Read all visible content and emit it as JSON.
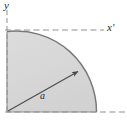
{
  "figure": {
    "name": "quarter-circle-quadrant-diagram",
    "shape": {
      "type": "quarter-circle",
      "center": {
        "x": 7,
        "y": 112
      },
      "radius": 90,
      "quadrant": "upper-right",
      "fill_color": "#d9d9d9",
      "outline_color": "#6e6e6e"
    },
    "axes": {
      "vertical": {
        "label": "y",
        "style": "dashed",
        "color": "#8a8a8a",
        "x": 7,
        "y_start": 10,
        "y_end": 112
      },
      "horizontal_top": {
        "label": "x'",
        "style": "dashed",
        "color": "#8a8a8a",
        "y": 30,
        "x_start": 7,
        "x_end": 104
      },
      "horizontal_bottom": {
        "label": "",
        "style": "dashed",
        "color": "#8a8a8a",
        "y": 112,
        "x_start": 7,
        "x_end": 125
      }
    },
    "dimension": {
      "label": "a",
      "arrow_from": {
        "x": 8,
        "y": 111
      },
      "arrow_to": {
        "x": 79,
        "y": 71
      },
      "color": "#4a4a4a"
    }
  },
  "labels": {
    "y_axis": "y",
    "x_prime_axis": "x'",
    "radius": "a"
  }
}
